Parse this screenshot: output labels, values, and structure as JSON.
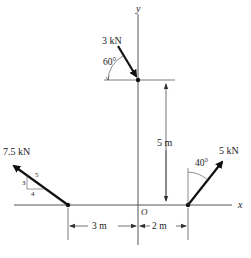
{
  "diagram": {
    "axes": {
      "x_label": "x",
      "y_label": "y",
      "origin_label": "O"
    },
    "forces": [
      {
        "id": "f1",
        "label": "3 kN",
        "angle_label": "60°",
        "angle_ref": "from horizontal"
      },
      {
        "id": "f2",
        "label": "7.5 kN",
        "slope": {
          "rise": "3",
          "run": "4",
          "hyp": "5"
        }
      },
      {
        "id": "f3",
        "label": "5 kN",
        "angle_label": "40°",
        "angle_ref": "from vertical"
      }
    ],
    "dimensions": [
      {
        "id": "d_vertical",
        "label": "5 m"
      },
      {
        "id": "d_left",
        "label": "3 m"
      },
      {
        "id": "d_right",
        "label": "2 m"
      }
    ],
    "colors": {
      "line": "#222222",
      "axis": "#555555"
    }
  }
}
